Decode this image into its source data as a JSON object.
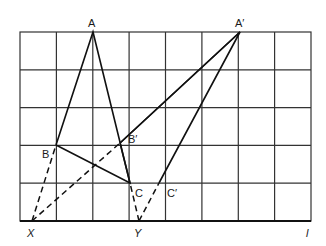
{
  "diagram": {
    "grid": {
      "left": 20,
      "top": 32,
      "right": 311,
      "bottom": 221,
      "cols": 8,
      "rows": 5,
      "color": "#333333"
    },
    "points": {
      "A": {
        "label": "A",
        "x": 93,
        "y": 32
      },
      "B": {
        "label": "B",
        "x": 56,
        "y": 145
      },
      "C": {
        "label": "C",
        "x": 130,
        "y": 183
      },
      "A1": {
        "label": "A′",
        "x": 240,
        "y": 32
      },
      "B1": {
        "label": "B′",
        "x": 120,
        "y": 143
      },
      "C1": {
        "label": "C′",
        "x": 159,
        "y": 183
      },
      "X": {
        "label": "X",
        "x": 32,
        "y": 221
      },
      "Y": {
        "label": "Y",
        "x": 139,
        "y": 221
      },
      "l": {
        "label": "l"
      }
    },
    "solid_segments": [
      [
        "A",
        "B"
      ],
      [
        "A",
        "C"
      ],
      [
        "B",
        "C"
      ],
      [
        "A1",
        "B1"
      ],
      [
        "A1",
        "C1"
      ],
      [
        "B1",
        "C"
      ]
    ],
    "dashed_segments": [
      [
        "X",
        "B"
      ],
      [
        "X",
        "B1"
      ],
      [
        "Y",
        "C"
      ],
      [
        "Y",
        "C1"
      ]
    ]
  }
}
